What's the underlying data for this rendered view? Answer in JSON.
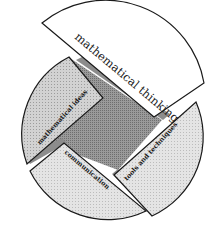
{
  "diagram": {
    "type": "segmented-circle",
    "segments": [
      {
        "id": "mathematical-thinking",
        "label": "mathematical thinking",
        "fill": "#ffffff",
        "detached": true
      },
      {
        "id": "mathematical-ideas",
        "label": "mathematical ideas",
        "fill": "#d6d6d6",
        "detached": false
      },
      {
        "id": "communication",
        "label": "communication",
        "fill": "#e2e2e2",
        "detached": false
      },
      {
        "id": "tools-and-techniques",
        "label": "tools and techniques",
        "fill": "#e0e0e0",
        "detached": false
      }
    ],
    "center": {
      "id": "core",
      "fill": "#8f8f8f"
    },
    "colors": {
      "outline": "#1a1a1a",
      "gap_band": "#9a9a9a",
      "background": "#ffffff"
    }
  }
}
